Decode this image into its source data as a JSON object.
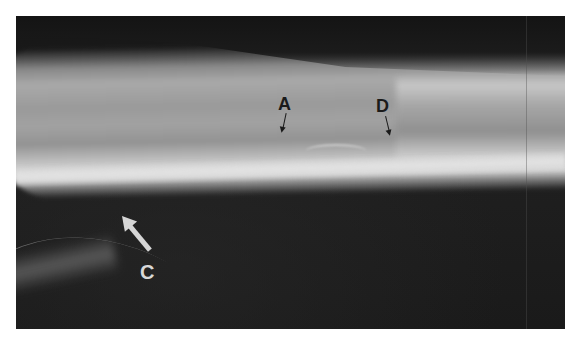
{
  "figure": {
    "background_color": "#1c1c1c",
    "bone_color": "#bdbdbd",
    "labels": [
      {
        "id": "A",
        "text": "A",
        "style": "dark",
        "pointer": "small-arrow-down"
      },
      {
        "id": "D",
        "text": "D",
        "style": "dark",
        "pointer": "small-arrow-down"
      },
      {
        "id": "C",
        "text": "C",
        "style": "light",
        "pointer": "large-arrow-up-left"
      }
    ]
  }
}
